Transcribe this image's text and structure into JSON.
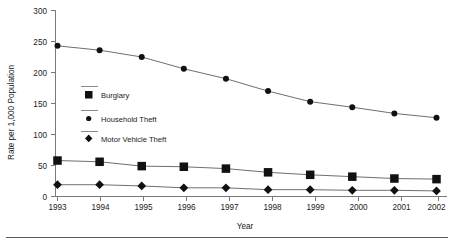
{
  "chart_data": {
    "type": "line",
    "title": "",
    "xlabel": "Year",
    "ylabel": "Rate per 1,000 Population",
    "categories": [
      "1993",
      "1994",
      "1995",
      "1996",
      "1997",
      "1998",
      "1999",
      "2000",
      "2001",
      "2002"
    ],
    "x": [
      1993,
      1994,
      1995,
      1996,
      1997,
      1998,
      1999,
      2000,
      2001,
      2002
    ],
    "xlim": [
      1993,
      2002
    ],
    "ylim": [
      0,
      300
    ],
    "yticks": [
      "0",
      "50",
      "100",
      "150",
      "200",
      "250",
      "300"
    ],
    "ytick_values": [
      0,
      50,
      100,
      150,
      200,
      250,
      300
    ],
    "grid": false,
    "legend_position": "inside-left-middle",
    "series": [
      {
        "name": "Burglary",
        "marker": "square",
        "values": [
          58,
          56,
          49,
          48,
          45,
          39,
          35,
          32,
          29,
          28
        ]
      },
      {
        "name": "Household Theft",
        "marker": "circle",
        "values": [
          243,
          236,
          225,
          206,
          190,
          170,
          153,
          144,
          134,
          127
        ]
      },
      {
        "name": "Motor Vehicle Theft",
        "marker": "diamond",
        "values": [
          19,
          19,
          17,
          14,
          14,
          11,
          11,
          10,
          10,
          9
        ]
      }
    ],
    "colors": {
      "line": "#6f6f6f",
      "marker": "#111111",
      "axis": "#7a7a7a",
      "text": "#222222",
      "rule": "#5b5b5b"
    }
  },
  "legend": {
    "entries": [
      {
        "label": "Burglary"
      },
      {
        "label": "Household Theft"
      },
      {
        "label": "Motor Vehicle Theft"
      }
    ]
  },
  "axes": {
    "y_title": "Rate per 1,000 Population",
    "x_title": "Year",
    "y_tick_labels": [
      "300",
      "250",
      "200",
      "150",
      "100",
      "50",
      "0"
    ],
    "x_tick_labels": [
      "1993",
      "1994",
      "1995",
      "1996",
      "1997",
      "1998",
      "1999",
      "2000",
      "2001",
      "2002"
    ]
  }
}
